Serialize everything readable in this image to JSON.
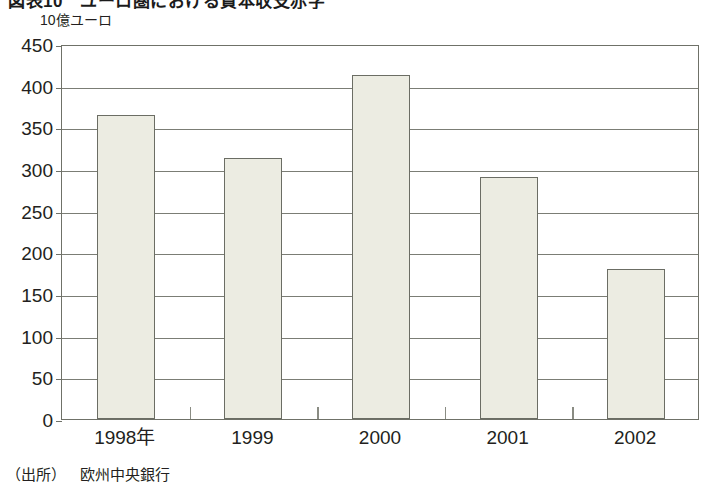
{
  "figure": {
    "heading": "図表10　ユーロ圏における資本収支赤字",
    "source_prefix": "（出所）",
    "source_org": "欧州中央銀行"
  },
  "chart_data": {
    "type": "bar",
    "title": "図表10　ユーロ圏における資本収支赤字",
    "unit_label": "10億ユーロ",
    "xlabel": "",
    "ylabel": "10億ユーロ",
    "categories": [
      "1998年",
      "1999",
      "2000",
      "2001",
      "2002"
    ],
    "values": [
      365,
      313,
      413,
      291,
      180
    ],
    "ylim": [
      0,
      450
    ],
    "ytick_step": 50,
    "yticks": [
      0,
      50,
      100,
      150,
      200,
      250,
      300,
      350,
      400,
      450
    ],
    "ytick_labels": [
      "0",
      "50",
      "100",
      "150",
      "200",
      "250",
      "300",
      "350",
      "400",
      "450"
    ],
    "grid": true,
    "legend": "none",
    "bar_fill_color": "#ecece2",
    "bar_edge_color": "#6b6d64",
    "axis_color": "#6f7168",
    "text_color": "#231f20",
    "background_color": "#ffffff"
  }
}
